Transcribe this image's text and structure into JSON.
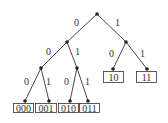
{
  "diagram": {
    "type": "binary-code-tree",
    "edge_labels": {
      "root_left": "0",
      "root_right": "1",
      "n0_left": "0",
      "n0_right": "1",
      "n1_left": "0",
      "n1_right": "1",
      "n00_left": "0",
      "n00_right": "1",
      "n01_left": "0",
      "n01_right": "1"
    },
    "leaves": [
      "000",
      "001",
      "010",
      "011",
      "10",
      "11"
    ]
  }
}
